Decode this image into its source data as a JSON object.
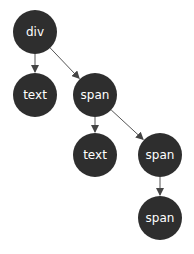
{
  "diagram": {
    "title": "",
    "nodes": [
      {
        "id": "n1",
        "label": "div",
        "cx": 35,
        "cy": 32
      },
      {
        "id": "n2",
        "label": "text",
        "cx": 35,
        "cy": 95
      },
      {
        "id": "n3",
        "label": "span",
        "cx": 95,
        "cy": 95
      },
      {
        "id": "n4",
        "label": "text",
        "cx": 95,
        "cy": 155
      },
      {
        "id": "n5",
        "label": "span",
        "cx": 160,
        "cy": 155
      },
      {
        "id": "n6",
        "label": "span",
        "cx": 160,
        "cy": 218
      }
    ],
    "edges": [
      {
        "from": "n1",
        "to": "n2"
      },
      {
        "from": "n1",
        "to": "n3"
      },
      {
        "from": "n3",
        "to": "n4"
      },
      {
        "from": "n3",
        "to": "n5"
      },
      {
        "from": "n5",
        "to": "n6"
      }
    ],
    "node_radius": 22,
    "node_color": "#2e2e2e",
    "edge_color": "#555555"
  }
}
